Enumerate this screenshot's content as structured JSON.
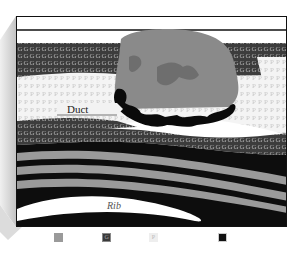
{
  "diagram": {
    "type": "anatomical cross-section",
    "labels": {
      "duct": "Duct",
      "rib": "Rib"
    },
    "pattern_letters": {
      "fat": "G",
      "parenchyma": "P"
    },
    "legend": [
      {
        "key": "skin",
        "label": "Skin",
        "color": "#ffffff"
      },
      {
        "key": "muscle",
        "label": "Muscle",
        "color": "#9a9a9a"
      },
      {
        "key": "fat",
        "label": "Fat",
        "color": "#3a3a3a",
        "glyph": "G"
      },
      {
        "key": "parenchyma",
        "label": "Parenchyma",
        "color": "#eeeeee",
        "glyph": "P"
      },
      {
        "key": "ribcage",
        "label": "Rib cage",
        "color": "#111111"
      }
    ],
    "colors": {
      "skin": "#ffffff",
      "fat": "#3a3a3a",
      "parenchyma": "#eeeeee",
      "lesion": "#8a8a8a",
      "lesion_inner": "#6e6e6e",
      "duct_black": "#0a0a0a",
      "muscle": "#9a9a9a",
      "ribcage": "#0d0d0d",
      "bevel": "#cfcfcf"
    }
  }
}
